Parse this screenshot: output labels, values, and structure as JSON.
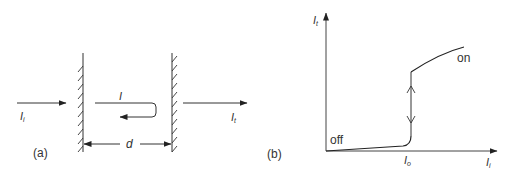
{
  "figure": {
    "panel_a": {
      "label": "(a)",
      "incident_symbol": "I",
      "incident_sub": "i",
      "transmitted_symbol": "I",
      "transmitted_sub": "t",
      "internal_symbol": "I",
      "spacing_symbol": "d",
      "mirror_left": "left-mirror",
      "mirror_right": "right-mirror"
    },
    "panel_b": {
      "label": "(b)",
      "y_axis_symbol": "I",
      "y_axis_sub": "t",
      "x_axis_symbol": "I",
      "x_axis_sub": "i",
      "threshold_symbol": "I",
      "threshold_sub": "o",
      "state_low": "off",
      "state_high": "on"
    },
    "colors": {
      "line": "#3a3a3a",
      "text": "#333333",
      "background": "#ffffff"
    }
  }
}
